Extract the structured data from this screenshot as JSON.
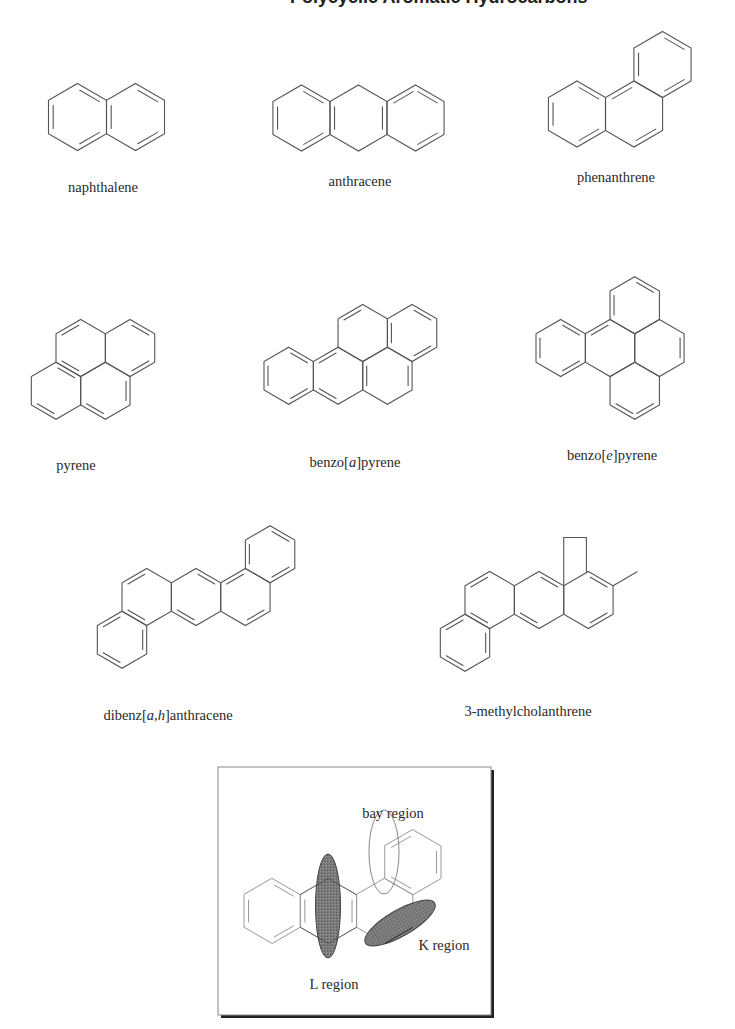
{
  "page": {
    "header_fragment": "Polycyclic Aromatic Hydrocarbons"
  },
  "molecules": [
    {
      "id": "naphthalene",
      "name": "naphthalene",
      "label": {
        "text": "naphthalene",
        "x": 103,
        "y": 192
      },
      "s": 33.5,
      "orient": "v",
      "rings": [
        [
          77.5,
          117
        ],
        [
          135.5,
          117
        ]
      ],
      "doubles": [
        [
          0,
          0,
          1
        ],
        [
          0,
          2,
          3
        ],
        [
          0,
          4,
          5
        ],
        [
          1,
          0,
          1
        ],
        [
          1,
          2,
          3
        ],
        [
          1,
          4,
          5
        ]
      ]
    },
    {
      "id": "anthracene",
      "name": "anthracene",
      "label": {
        "text": "anthracene",
        "x": 360,
        "y": 186
      },
      "s": 33,
      "orient": "v",
      "rings": [
        [
          301.5,
          118
        ],
        [
          358.5,
          118
        ],
        [
          415.5,
          118
        ]
      ],
      "doubles": [
        [
          0,
          0,
          1
        ],
        [
          0,
          2,
          3
        ],
        [
          0,
          4,
          5
        ],
        [
          1,
          1,
          2
        ],
        [
          1,
          4,
          5
        ],
        [
          2,
          0,
          1
        ],
        [
          2,
          2,
          3
        ],
        [
          2,
          5,
          0
        ]
      ]
    },
    {
      "id": "phenanthrene",
      "name": "phenanthrene",
      "label": {
        "text": "phenanthrene",
        "x": 616,
        "y": 182
      },
      "s": 33,
      "orient": "v",
      "rings": [
        [
          577,
          114
        ],
        [
          634,
          114
        ],
        [
          662.5,
          64.5
        ]
      ],
      "doubles": [
        [
          0,
          0,
          1
        ],
        [
          0,
          2,
          3
        ],
        [
          0,
          4,
          5
        ],
        [
          1,
          2,
          3
        ],
        [
          1,
          5,
          0
        ],
        [
          2,
          0,
          1
        ],
        [
          2,
          2,
          3
        ],
        [
          2,
          4,
          5
        ]
      ]
    },
    {
      "id": "pyrene",
      "name": "pyrene",
      "label": {
        "text": "pyrene",
        "x": 76,
        "y": 470
      },
      "s": 28.5,
      "orient": "v",
      "rings": [
        [
          74.5,
          365
        ],
        [
          124,
          365
        ],
        [
          49.5,
          408
        ],
        [
          99,
          408
        ],
        [
          148.5,
          408
        ],
        [
          124,
          322
        ]
      ],
      "doubles": [],
      "custom": "pyrene"
    },
    {
      "id": "benzo-a-pyrene",
      "name": "benzo[a]pyrene",
      "label": {
        "text": "benzo[a]pyrene",
        "x": 355,
        "y": 467,
        "italic_part": "a"
      },
      "s": 28.5,
      "orient": "v",
      "custom": "bap"
    },
    {
      "id": "benzo-e-pyrene",
      "name": "benzo[e]pyrene",
      "label": {
        "text": "benzo[e]pyrene",
        "x": 612,
        "y": 460,
        "italic_part": "e"
      },
      "s": 28.5,
      "orient": "v",
      "custom": "bep"
    },
    {
      "id": "dibenz-ah-anthracene",
      "name": "dibenz[a,h]anthracene",
      "label": {
        "text": "dibenz[a,h]anthracene",
        "x": 168,
        "y": 720,
        "italic_part": "a,h"
      },
      "s": 28.5,
      "orient": "v",
      "custom": "dbaha"
    },
    {
      "id": "3-methylcholanthrene",
      "name": "3-methylcholanthrene",
      "label": {
        "text": "3-methylcholanthrene",
        "x": 528,
        "y": 716
      },
      "s": 28.5,
      "orient": "v",
      "custom": "mc"
    }
  ],
  "inset": {
    "box": {
      "x": 218,
      "y": 767,
      "w": 273,
      "h": 248
    },
    "molecule": "benz[a]anthracene",
    "labels": {
      "bay": {
        "text": "bay region",
        "x": 393,
        "y": 818
      },
      "k": {
        "text": "K region",
        "x": 444,
        "y": 950
      },
      "l": {
        "text": "L region",
        "x": 334,
        "y": 989
      }
    },
    "regions": {
      "l_region": {
        "cx": 328,
        "cy": 906,
        "rx": 12.5,
        "ry": 52,
        "rotate": 0,
        "fill": "#6e6e6e"
      },
      "bay_region": {
        "cx": 384,
        "cy": 852,
        "rx": 15,
        "ry": 42,
        "rotate": 0,
        "fill": "none"
      },
      "k_region": {
        "cx": 400,
        "cy": 923,
        "rx": 40,
        "ry": 13,
        "rotate": -30,
        "fill": "#6e6e6e"
      }
    }
  }
}
